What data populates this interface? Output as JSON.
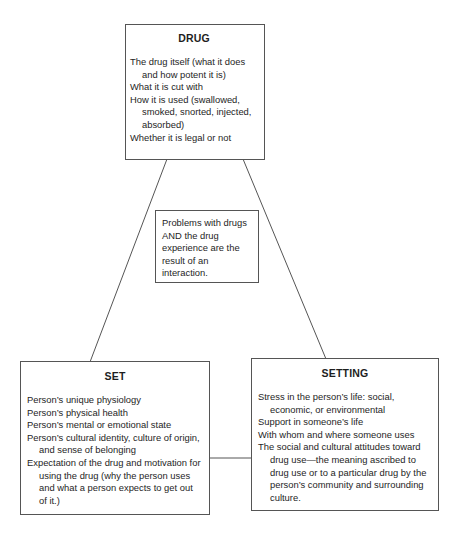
{
  "diagram": {
    "type": "triangle-interaction-model",
    "nodes": {
      "drug": {
        "title": "DRUG",
        "items": [
          "The drug itself (what it does and how potent it is)",
          "What it is cut with",
          "How it is used (swallowed, smoked, snorted, injected, absorbed)",
          "Whether it is legal or not"
        ]
      },
      "set": {
        "title": "SET",
        "items": [
          "Person’s unique physiology",
          "Person’s physical health",
          "Person’s mental or emotional state",
          "Person’s cultural identity, culture of origin, and sense of belonging",
          "Expectation of the drug and motivation for using the drug (why the person uses and what a person expects to get out of it.)"
        ]
      },
      "setting": {
        "title": "SETTING",
        "items": [
          "Stress in the person’s life: social, economic, or environmental",
          "Support in someone’s life",
          "With whom and where someone uses",
          "The social and cultural attitudes toward drug use—the meaning ascribed to drug use or to a particular drug by the person’s community and surrounding culture."
        ]
      },
      "center": {
        "text": "Problems with drugs AND the drug experience are the result of an interaction."
      }
    },
    "edges": [
      {
        "from": "drug",
        "to": "set"
      },
      {
        "from": "drug",
        "to": "setting"
      },
      {
        "from": "set",
        "to": "setting"
      }
    ],
    "colors": {
      "line": "#555555",
      "text": "#1e1e1e",
      "background": "#ffffff"
    }
  }
}
